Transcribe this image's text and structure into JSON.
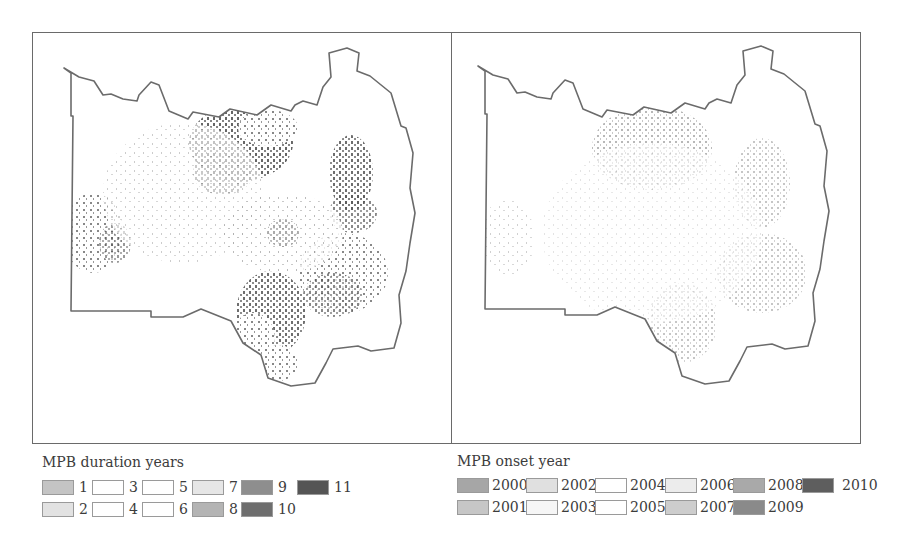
{
  "figure": {
    "panels": [
      {
        "id": "duration",
        "map_title": "MPB duration years",
        "description": "Mountain pine beetle infestation duration map",
        "outline_color": "#6b6b6b",
        "fill_density": "high"
      },
      {
        "id": "onset",
        "map_title": "MPB onset year",
        "description": "Mountain pine beetle infestation onset year map",
        "outline_color": "#6b6b6b",
        "fill_density": "low"
      }
    ]
  },
  "legend_duration": {
    "title": "MPB duration years",
    "items": [
      {
        "label": "1",
        "color": "#c4c4c4"
      },
      {
        "label": "2",
        "color": "#e2e2e2"
      },
      {
        "label": "3",
        "color": "#ffffff"
      },
      {
        "label": "4",
        "color": "#ffffff"
      },
      {
        "label": "5",
        "color": "#ffffff"
      },
      {
        "label": "6",
        "color": "#ffffff"
      },
      {
        "label": "7",
        "color": "#e6e6e6"
      },
      {
        "label": "8",
        "color": "#b4b4b4"
      },
      {
        "label": "9",
        "color": "#8e8e8e"
      },
      {
        "label": "10",
        "color": "#6e6e6e"
      },
      {
        "label": "11",
        "color": "#555555"
      }
    ]
  },
  "legend_onset": {
    "title": "MPB onset year",
    "items": [
      {
        "label": "2000",
        "color": "#a6a6a6"
      },
      {
        "label": "2001",
        "color": "#c6c6c6"
      },
      {
        "label": "2002",
        "color": "#e0e0e0"
      },
      {
        "label": "2003",
        "color": "#f6f6f6"
      },
      {
        "label": "2004",
        "color": "#ffffff"
      },
      {
        "label": "2005",
        "color": "#ffffff"
      },
      {
        "label": "2006",
        "color": "#ececec"
      },
      {
        "label": "2007",
        "color": "#cdcdcd"
      },
      {
        "label": "2008",
        "color": "#a9a9a9"
      },
      {
        "label": "2009",
        "color": "#8a8a8a"
      },
      {
        "label": "2010",
        "color": "#5e5e5e"
      }
    ]
  }
}
